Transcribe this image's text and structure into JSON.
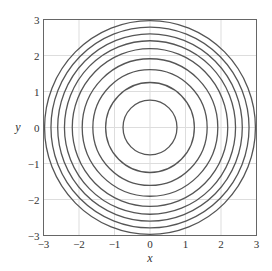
{
  "chart_data": {
    "type": "line",
    "subtype": "contour",
    "title": "",
    "xlabel": "x",
    "ylabel": "y",
    "xlim": [
      -3,
      3
    ],
    "ylim": [
      -3,
      3
    ],
    "grid": true,
    "legend": null,
    "xticks": [
      -3,
      -2,
      -1,
      0,
      1,
      2,
      3
    ],
    "yticks": [
      -3,
      -2,
      -1,
      0,
      1,
      2,
      3
    ],
    "xtick_labels": [
      "−3",
      "−2",
      "−1",
      "0",
      "1",
      "2",
      "3"
    ],
    "ytick_labels": [
      "−3",
      "−2",
      "−1",
      "0",
      "1",
      "2",
      "3"
    ],
    "series": [
      {
        "name": "level curves (concentric circles centered at origin)",
        "center": [
          0,
          0
        ],
        "radii": [
          0.76,
          1.25,
          1.61,
          1.91,
          2.19,
          2.41,
          2.6,
          2.79,
          2.97
        ]
      }
    ]
  },
  "colors": {
    "curve": "#555555",
    "grid": "#dddddd",
    "frame": "#666666",
    "text": "#333333"
  }
}
